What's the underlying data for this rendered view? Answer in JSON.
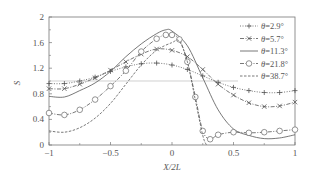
{
  "chart_data": {
    "type": "line",
    "title": "",
    "xlabel": "X/2L",
    "ylabel": "S",
    "xlim": [
      -1,
      1
    ],
    "ylim": [
      0,
      2
    ],
    "xticks": [
      "-1",
      "-0.5",
      "0",
      "0.5",
      "1"
    ],
    "yticks": [
      "0",
      "0.4",
      "0.8",
      "1.2",
      "1.6",
      "2"
    ],
    "grid": false,
    "legend_position": "upper right",
    "reference_line": {
      "y": 1.0,
      "x_range": [
        -1,
        0.58
      ]
    },
    "series": [
      {
        "name": "θ=2.9°",
        "style": "dotted-plus",
        "x": [
          -1,
          -0.875,
          -0.75,
          -0.625,
          -0.5,
          -0.375,
          -0.25,
          -0.125,
          0,
          0.125,
          0.25,
          0.375,
          0.5,
          0.625,
          0.75,
          0.875,
          1
        ],
        "y": [
          0.96,
          0.96,
          1.0,
          1.06,
          1.15,
          1.22,
          1.27,
          1.28,
          1.25,
          1.18,
          1.08,
          0.98,
          0.9,
          0.85,
          0.82,
          0.82,
          0.85
        ]
      },
      {
        "name": "θ=5.7°",
        "style": "dashdot-x",
        "x": [
          -1,
          -0.875,
          -0.75,
          -0.625,
          -0.5,
          -0.375,
          -0.25,
          -0.125,
          0,
          0.125,
          0.25,
          0.375,
          0.5,
          0.625,
          0.75,
          0.875,
          1
        ],
        "y": [
          0.88,
          0.88,
          0.95,
          1.05,
          1.17,
          1.3,
          1.42,
          1.5,
          1.48,
          1.38,
          1.18,
          0.95,
          0.78,
          0.66,
          0.6,
          0.61,
          0.67
        ]
      },
      {
        "name": "θ=11.3°",
        "style": "solid",
        "x": [
          -1,
          -0.875,
          -0.75,
          -0.625,
          -0.5,
          -0.375,
          -0.25,
          -0.125,
          -0.05,
          0,
          0.125,
          0.25,
          0.375,
          0.5,
          0.625,
          0.75,
          0.875,
          1
        ],
        "y": [
          0.76,
          0.75,
          0.85,
          0.97,
          1.15,
          1.38,
          1.58,
          1.74,
          1.8,
          1.78,
          1.55,
          1.05,
          0.55,
          0.25,
          0.15,
          0.1,
          0.11,
          0.16
        ]
      },
      {
        "name": "θ=21.8°",
        "style": "dashdot-circle",
        "x": [
          -1,
          -0.875,
          -0.75,
          -0.625,
          -0.5,
          -0.375,
          -0.25,
          -0.125,
          -0.05,
          0,
          0.06,
          0.125,
          0.19,
          0.25,
          0.31,
          0.375,
          0.5,
          0.625,
          0.75,
          0.875,
          1
        ],
        "y": [
          0.5,
          0.47,
          0.55,
          0.71,
          0.92,
          1.16,
          1.46,
          1.66,
          1.72,
          1.72,
          1.65,
          1.3,
          0.75,
          0.22,
          0.09,
          0.16,
          0.2,
          0.19,
          0.2,
          0.22,
          0.24
        ]
      },
      {
        "name": "θ=38.7°",
        "style": "dashed",
        "x": [
          -1,
          -0.875,
          -0.75,
          -0.625,
          -0.5,
          -0.375,
          -0.25,
          -0.125,
          0,
          0.06,
          0.125,
          0.19,
          0.25,
          0.28
        ],
        "y": [
          0.22,
          0.2,
          0.27,
          0.42,
          0.65,
          0.95,
          1.25,
          1.48,
          1.6,
          1.62,
          1.3,
          0.7,
          0.15,
          0.0
        ]
      }
    ]
  },
  "legend": {
    "items": [
      "θ=2.9°",
      "θ=5.7°",
      "θ=11.3°",
      "θ=21.8°",
      "θ=38.7°"
    ]
  },
  "axes": {
    "xlabel": "X/2L",
    "ylabel": "S"
  }
}
